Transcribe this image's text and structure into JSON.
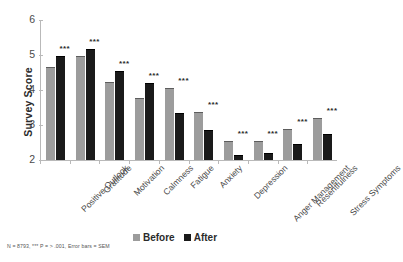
{
  "chart_data": {
    "type": "bar",
    "title": "",
    "xlabel": "",
    "ylabel": "Survey Score",
    "ylim": [
      2,
      6
    ],
    "yticks": [
      2,
      3,
      4,
      5,
      6
    ],
    "grid": false,
    "legend_position": "bottom",
    "categories": [
      "Positive Outlook",
      "Gratitude",
      "Motivation",
      "Calmness",
      "Fatigue",
      "Anxiety",
      "Depression",
      "Anger Management",
      "Resentfulness",
      "Stress Symptoms"
    ],
    "series": [
      {
        "name": "Before",
        "color": "#9c9c9c",
        "values": [
          4.67,
          4.96,
          4.24,
          3.76,
          4.05,
          3.38,
          2.53,
          2.55,
          2.89,
          3.21
        ]
      },
      {
        "name": "After",
        "color": "#1a1a1a",
        "values": [
          4.98,
          5.17,
          4.54,
          4.19,
          3.34,
          2.85,
          2.15,
          2.2,
          2.47,
          2.73
        ]
      }
    ],
    "annotations": [
      {
        "category": "Positive Outlook",
        "text": "***"
      },
      {
        "category": "Gratitude",
        "text": "***"
      },
      {
        "category": "Motivation",
        "text": "***"
      },
      {
        "category": "Calmness",
        "text": "***"
      },
      {
        "category": "Fatigue",
        "text": "***"
      },
      {
        "category": "Anxiety",
        "text": "***"
      },
      {
        "category": "Depression",
        "text": "***"
      },
      {
        "category": "Anger Management",
        "text": "***"
      },
      {
        "category": "Resentfulness",
        "text": "***"
      },
      {
        "category": "Stress Symptoms",
        "text": "***"
      }
    ],
    "error_bars": "SEM",
    "footnote": "N = 8793, *** P = > .001, Error bars = SEM"
  },
  "legend": {
    "items": [
      {
        "label": "Before",
        "color": "#9c9c9c"
      },
      {
        "label": "After",
        "color": "#1a1a1a"
      }
    ]
  }
}
